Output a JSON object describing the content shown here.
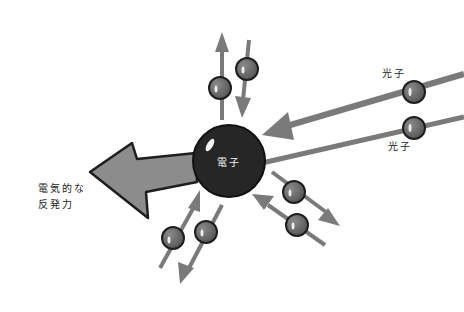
{
  "diagram": {
    "electron": {
      "label": "電子",
      "cx": 229,
      "cy": 161,
      "r": 36,
      "color": "#262626"
    },
    "repulsion_force": {
      "label_line1": "電気的な",
      "label_line2": "反発力",
      "color": "#8a8a8a"
    },
    "photons": [
      {
        "label": "光子",
        "cx": 414,
        "cy": 92
      },
      {
        "label": "光子",
        "cx": 414,
        "cy": 128
      }
    ],
    "virtual_particles": [
      {
        "cx": 220,
        "cy": 88
      },
      {
        "cx": 247,
        "cy": 69
      },
      {
        "cx": 173,
        "cy": 238
      },
      {
        "cx": 206,
        "cy": 232
      },
      {
        "cx": 294,
        "cy": 192
      },
      {
        "cx": 297,
        "cy": 225
      }
    ],
    "colors": {
      "particle": "#6e6e6e",
      "outline": "#1e1e1e",
      "line": "#7a7a7a",
      "arrow_fill": "#8c8c8c"
    }
  }
}
